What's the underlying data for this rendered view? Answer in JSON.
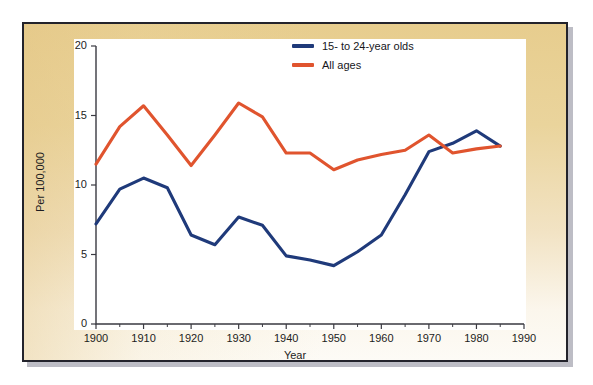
{
  "figure": {
    "frame_border_color": "#23232b",
    "background_top_color": "#e7cd8e",
    "background_bottom_color": "#fdfbf6",
    "plot_background_color": "#ffffff"
  },
  "legend": {
    "position": "top-right",
    "entries": [
      {
        "label": "15- to 24-year olds",
        "color": "#1f3a7a",
        "swatch_name": "legend-swatch-youth"
      },
      {
        "label": "All ages",
        "color": "#e0542e",
        "swatch_name": "legend-swatch-all-ages"
      }
    ]
  },
  "axes": {
    "x": {
      "title": "Year",
      "min": 1900,
      "max": 1990,
      "major_ticks": [
        1900,
        1910,
        1920,
        1930,
        1940,
        1950,
        1960,
        1970,
        1980,
        1990
      ],
      "minor_ticks": [
        1905,
        1915,
        1925,
        1935,
        1945,
        1955,
        1965,
        1975,
        1985
      ],
      "tick_labels": [
        "1900",
        "1910",
        "1920",
        "1930",
        "1940",
        "1950",
        "1960",
        "1970",
        "1980",
        "1990"
      ]
    },
    "y": {
      "title": "Per 100,000",
      "min": 0,
      "max": 20,
      "major_ticks": [
        0,
        5,
        10,
        15,
        20
      ],
      "tick_labels": [
        "0",
        "5",
        "10",
        "15",
        "20"
      ]
    }
  },
  "chart_data": {
    "type": "line",
    "title": "",
    "subtitle": "",
    "xlabel": "Year",
    "ylabel": "Per 100,000",
    "xlim": [
      1900,
      1990
    ],
    "ylim": [
      0,
      20
    ],
    "grid": false,
    "legend_position": "top-right",
    "x": [
      1900,
      1905,
      1910,
      1915,
      1920,
      1925,
      1930,
      1935,
      1940,
      1945,
      1950,
      1955,
      1960,
      1965,
      1970,
      1975,
      1980,
      1985
    ],
    "series": [
      {
        "name": "15- to 24-year olds",
        "color": "#1f3a7a",
        "values": [
          7.2,
          9.7,
          10.5,
          9.8,
          6.4,
          5.7,
          7.7,
          7.1,
          4.9,
          4.6,
          4.2,
          5.2,
          6.4,
          9.3,
          12.4,
          13.0,
          13.9,
          12.8
        ]
      },
      {
        "name": "All ages",
        "color": "#e0542e",
        "values": [
          11.5,
          14.2,
          15.7,
          13.6,
          11.4,
          13.6,
          15.9,
          14.9,
          12.3,
          12.3,
          11.1,
          11.8,
          12.2,
          12.5,
          13.6,
          12.3,
          12.6,
          12.8
        ]
      }
    ],
    "annotations": []
  }
}
